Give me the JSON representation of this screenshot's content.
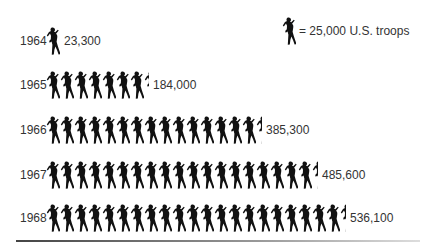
{
  "legend": {
    "label": "= 25,000 U.S. troops",
    "unit_value": 25000
  },
  "rows": [
    {
      "year": "1964",
      "value_label": "23,300",
      "full": 0,
      "partial": 0.93
    },
    {
      "year": "1965",
      "value_label": "184,000",
      "full": 7,
      "partial": 0.36
    },
    {
      "year": "1966",
      "value_label": "385,300",
      "full": 15,
      "partial": 0.41
    },
    {
      "year": "1967",
      "value_label": "485,600",
      "full": 19,
      "partial": 0.42
    },
    {
      "year": "1968",
      "value_label": "536,100",
      "full": 21,
      "partial": 0.44
    }
  ],
  "chart_data": {
    "type": "bar",
    "subtype": "pictogram",
    "title": "",
    "categories": [
      "1964",
      "1965",
      "1966",
      "1967",
      "1968"
    ],
    "values": [
      23300,
      184000,
      385300,
      485600,
      536100
    ],
    "series": [
      {
        "name": "U.S. troops",
        "values": [
          23300,
          184000,
          385300,
          485600,
          536100
        ]
      }
    ],
    "legend": "one soldier icon = 25,000 U.S. troops",
    "orientation": "horizontal",
    "xlabel": "",
    "ylabel": "",
    "grid": false
  }
}
